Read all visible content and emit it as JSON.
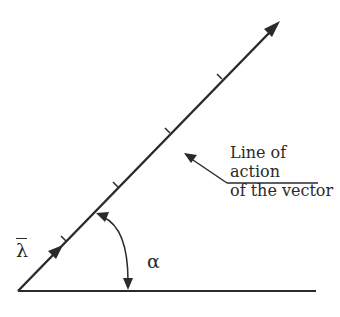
{
  "diagram": {
    "annotation": {
      "line1": "Line of action",
      "line2": "of the vector"
    },
    "unit_vector_label": "λ",
    "angle_label": "α",
    "colors": {
      "stroke": "#2a2a2a",
      "background": "#ffffff"
    }
  }
}
